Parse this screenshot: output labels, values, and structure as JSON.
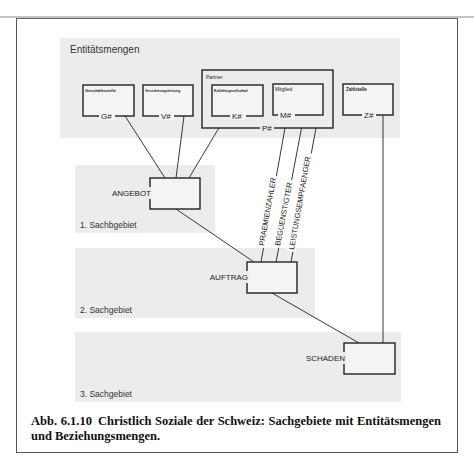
{
  "figure": {
    "caption_number": "Abb. 6.1.10",
    "caption_text": "Christlich Soziale der Schweiz: Sachgebiete mit Entitätsmengen und Beziehungsmengen."
  },
  "regions": {
    "entities": {
      "label": "Entitätsmengen"
    },
    "area1": {
      "label": "1. Sachbgebiet"
    },
    "area2": {
      "label": "2. Sachgebiet"
    },
    "area3": {
      "label": "3. Sachgebiet"
    }
  },
  "entities": [
    {
      "id": "geschaeftsstelle",
      "name": "Geschäftsstelle",
      "key": "G#"
    },
    {
      "id": "versicherungsleistung",
      "name": "Versicherungsleistung",
      "key": "V#"
    },
    {
      "id": "kollektivgesellschaft",
      "name": "Kollektivgesellschaft",
      "key": "K#"
    },
    {
      "id": "mitglied",
      "name": "Mitglied",
      "key": "M#"
    },
    {
      "id": "zahlstelle",
      "name": "Zahlstelle",
      "key": "Z#"
    }
  ],
  "partner": {
    "name": "Partner",
    "key": "P#"
  },
  "relationships": [
    {
      "id": "angebot",
      "name": "ANGEBOT"
    },
    {
      "id": "auftrag",
      "name": "AUFTRAG"
    },
    {
      "id": "schaden",
      "name": "SCHADEN"
    }
  ],
  "roles": [
    {
      "name": "PRAEMIENZAHLER"
    },
    {
      "name": "BEGUENSTIGTER"
    },
    {
      "name": "LEISTUNGSEMPFAENGER"
    }
  ],
  "colors": {
    "region_fill": "#ececec",
    "line": "#222222",
    "box_fill": "#f4f4f4"
  }
}
